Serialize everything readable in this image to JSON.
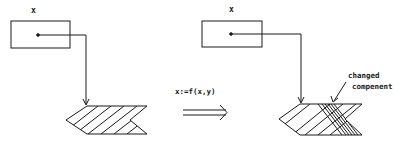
{
  "before": {
    "variable_label": "x"
  },
  "after": {
    "variable_label": "x",
    "annotation": [
      "changed",
      "compenent"
    ]
  },
  "transition": {
    "label": "x:=f(x,y)",
    "arrow": "double-arrow-right"
  },
  "colors": {
    "ink": "#1a1a1a",
    "background": "#ffffff"
  }
}
